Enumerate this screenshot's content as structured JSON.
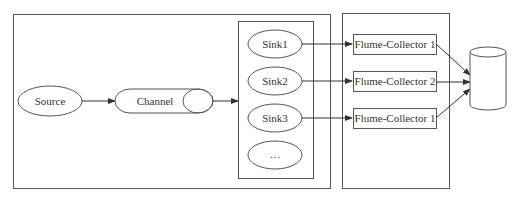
{
  "diagram": {
    "source": {
      "label": "Source"
    },
    "channel": {
      "label": "Channel"
    },
    "sinks": [
      {
        "label": "Sink1"
      },
      {
        "label": "Sink2"
      },
      {
        "label": "Sink3"
      },
      {
        "label": "…"
      }
    ],
    "collectors": [
      {
        "label": "Flume-Collector 1"
      },
      {
        "label": "Flume-Collector 2"
      },
      {
        "label": "Flume-Collector 1"
      }
    ],
    "storage": {
      "shape": "cylinder"
    },
    "colors": {
      "stroke": "#555555",
      "text": "#333333",
      "background": "#ffffff"
    }
  }
}
